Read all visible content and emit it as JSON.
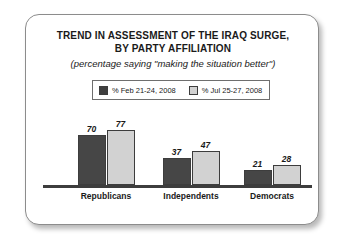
{
  "chart_data": {
    "type": "bar",
    "title": "TREND IN ASSESSMENT OF THE IRAQ SURGE, BY PARTY AFFILIATION",
    "title_lines": [
      "TREND IN ASSESSMENT OF THE IRAQ SURGE,",
      "BY PARTY AFFILIATION"
    ],
    "subtitle": "(percentage saying \"making the situation better\")",
    "categories": [
      "Republicans",
      "Independents",
      "Democrats"
    ],
    "series": [
      {
        "name": "% Feb 21-24, 2008",
        "values": [
          70,
          37,
          21
        ],
        "color": "#464646"
      },
      {
        "name": "% Jul 25-27, 2008",
        "values": [
          77,
          47,
          28
        ],
        "color": "#d2d2d2"
      }
    ],
    "xlabel": "",
    "ylabel": "",
    "ylim": [
      0,
      100
    ],
    "grid": false,
    "axis": "baseline-only",
    "legend_position": "top-center",
    "data_labels": true
  },
  "legend": {
    "entries": [
      {
        "label": "% Feb 21-24, 2008",
        "swatch": "dark"
      },
      {
        "label": "% Jul 25-27, 2008",
        "swatch": "light"
      }
    ]
  },
  "colors": {
    "series_dark": "#464646",
    "series_light": "#d2d2d2",
    "axis": "#3d3d3d",
    "frame_border": "#8c8c8c",
    "text": "#1a1a1a",
    "background": "#ffffff"
  }
}
